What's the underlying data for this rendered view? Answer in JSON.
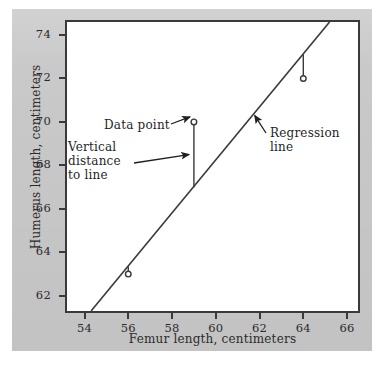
{
  "figure": {
    "background_color": "#c9c9c9",
    "plot_background_color": "#ffffff",
    "ink_color": "#3a3a3a"
  },
  "chart_data": {
    "type": "scatter",
    "title": "",
    "xlabel": "Femur length, centimeters",
    "ylabel": "Humerus length, centimeters",
    "xlim": [
      53.2,
      66.5
    ],
    "ylim": [
      61.3,
      74.6
    ],
    "xticks": [
      54,
      56,
      58,
      60,
      62,
      64,
      66
    ],
    "yticks": [
      62,
      64,
      66,
      68,
      70,
      72,
      74
    ],
    "xticklabels": [
      "54",
      "56",
      "58",
      "60",
      "62",
      "64",
      "66"
    ],
    "yticklabels": [
      "62",
      "64",
      "66",
      "68",
      "70",
      "72",
      "74"
    ],
    "grid": false,
    "legend": false,
    "points": [
      {
        "x": 56,
        "y": 63
      },
      {
        "x": 59,
        "y": 70
      },
      {
        "x": 64,
        "y": 72
      }
    ],
    "series": [
      {
        "name": "Data point",
        "marker": "open-circle",
        "x": [
          56,
          59,
          64
        ],
        "y": [
          63,
          70,
          72
        ]
      },
      {
        "name": "Regression line",
        "type": "line",
        "x": [
          54.3,
          65.2
        ],
        "y": [
          61.3,
          74.6
        ]
      }
    ],
    "residual_segments": [
      {
        "x": 56,
        "y_point": 63,
        "y_line": 63.35
      },
      {
        "x": 59,
        "y_point": 70,
        "y_line": 67.0
      },
      {
        "x": 64,
        "y_point": 72,
        "y_line": 73.1
      }
    ],
    "annotations": [
      {
        "name": "data-point",
        "text": "Data point",
        "points_to": {
          "x": 59,
          "y": 70
        }
      },
      {
        "name": "vertical-distance",
        "text": "Vertical\ndistance\nto line",
        "points_to": {
          "x": 59,
          "y": 68.5
        }
      },
      {
        "name": "regression-line",
        "text": "Regression\nline",
        "points_to": {
          "x": 61.6,
          "y": 70.2
        }
      }
    ]
  },
  "axes": {
    "x_label": "Femur length, centimeters",
    "y_label": "Humerus length, centimeters"
  },
  "annotations": {
    "data_point": "Data point",
    "vertical_distance": "Vertical\ndistance\nto line",
    "regression_line": "Regression\nline"
  }
}
